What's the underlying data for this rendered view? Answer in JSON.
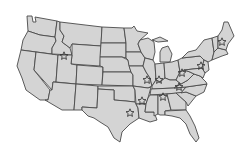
{
  "map": {
    "region": "Contiguous United States",
    "fill_color": "#d4d4d4",
    "border_color": "#4a4a4a",
    "marker_color": "#3a3a3a",
    "marker_icon": "star-icon",
    "markers": [
      {
        "x": 64,
        "y": 56
      },
      {
        "x": 222,
        "y": 42
      },
      {
        "x": 201,
        "y": 66
      },
      {
        "x": 182,
        "y": 73
      },
      {
        "x": 147,
        "y": 80
      },
      {
        "x": 159,
        "y": 80
      },
      {
        "x": 179,
        "y": 87
      },
      {
        "x": 163,
        "y": 97
      },
      {
        "x": 142,
        "y": 101
      },
      {
        "x": 130,
        "y": 113
      }
    ]
  }
}
